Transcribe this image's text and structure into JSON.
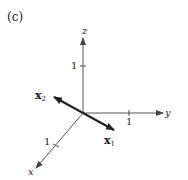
{
  "figure": {
    "panel_label": "(c)",
    "axes": {
      "z": {
        "label": "z",
        "tick_label": "1"
      },
      "y": {
        "label": "y",
        "tick_label": "1"
      },
      "x": {
        "label": "x",
        "tick_label": "1"
      }
    },
    "vectors": [
      {
        "name": "x",
        "subscript": "1",
        "style": "bold"
      },
      {
        "name": "x",
        "subscript": "2",
        "style": "bold"
      }
    ],
    "colors": {
      "axis": "#555555",
      "vector": "#222222",
      "background": "#ffffff"
    }
  }
}
